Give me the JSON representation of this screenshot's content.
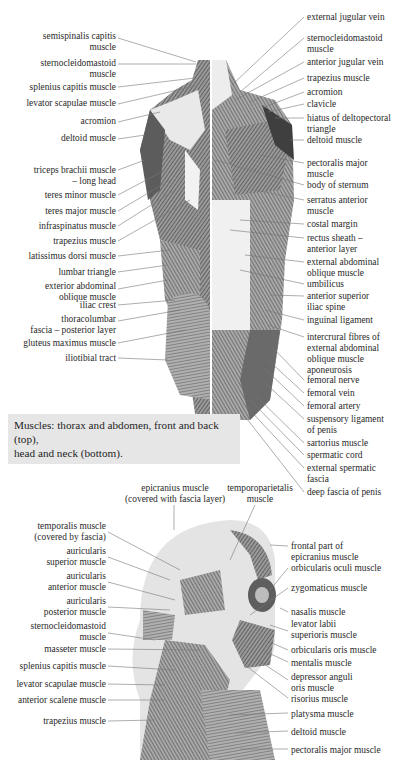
{
  "caption": {
    "line1": "Muscles: thorax and abdomen, front and back (top),",
    "line2": "head and neck (bottom)."
  },
  "top_figure": {
    "back_labels": [
      {
        "l1": "semispinalis capitis",
        "l2": "muscle"
      },
      {
        "l1": "sternocleidomastoid",
        "l2": "muscle"
      },
      {
        "l1": "splenius capitis muscle"
      },
      {
        "l1": "levator scapulae muscle"
      },
      {
        "l1": "acromion"
      },
      {
        "l1": "deltoid muscle"
      },
      {
        "l1": "triceps brachii muscle",
        "l2": "– long head"
      },
      {
        "l1": "teres minor muscle"
      },
      {
        "l1": "teres major muscle"
      },
      {
        "l1": "infraspinatus muscle"
      },
      {
        "l1": "trapezius muscle"
      },
      {
        "l1": "latissimus dorsi muscle"
      },
      {
        "l1": "lumbar triangle"
      },
      {
        "l1": "exterior abdominal",
        "l2": "oblique muscle"
      },
      {
        "l1": "iliac crest"
      },
      {
        "l1": "thoracolumbar",
        "l2": "fascia – posterior layer"
      },
      {
        "l1": "gluteus maximus muscle"
      },
      {
        "l1": "iliotibial tract"
      }
    ],
    "front_labels": [
      {
        "l1": "external jugular vein"
      },
      {
        "l1": "sternocleidomastoid",
        "l2": "muscle"
      },
      {
        "l1": "anterior jugular vein"
      },
      {
        "l1": "trapezius muscle"
      },
      {
        "l1": "acromion"
      },
      {
        "l1": "clavicle"
      },
      {
        "l1": "hiatus of deltopectoral",
        "l2": "triangle"
      },
      {
        "l1": "deltoid muscle"
      },
      {
        "l1": "pectoralis major",
        "l2": "muscle"
      },
      {
        "l1": "body of sternum"
      },
      {
        "l1": "serratus anterior",
        "l2": "muscle"
      },
      {
        "l1": "costal margin"
      },
      {
        "l1": "rectus sheath –",
        "l2": "anterior layer"
      },
      {
        "l1": "external abdominal",
        "l2": "oblique muscle"
      },
      {
        "l1": "umbilicus"
      },
      {
        "l1": "anterior superior",
        "l2": "iliac spine"
      },
      {
        "l1": "inguinal ligament"
      },
      {
        "l1": "intercrural fibres of",
        "l2": "external abdominal",
        "l3": "oblique muscle",
        "l4": "aponeurosis"
      },
      {
        "l1": "femoral nerve"
      },
      {
        "l1": "femoral vein"
      },
      {
        "l1": "femoral artery"
      },
      {
        "l1": "suspensory ligament",
        "l2": "of penis"
      },
      {
        "l1": "sartorius muscle"
      },
      {
        "l1": "spermatic cord"
      },
      {
        "l1": "external spermatic",
        "l2": "fascia"
      },
      {
        "l1": "deep fascia of penis"
      }
    ]
  },
  "bottom_figure": {
    "top_labels": [
      {
        "l1": "epicranius muscle",
        "l2": "(covered with fascia layer)"
      },
      {
        "l1": "temporoparietalis",
        "l2": "muscle"
      }
    ],
    "left_labels": [
      {
        "l1": "temporalis muscle",
        "l2": "(covered by fascia)"
      },
      {
        "l1": "auricularis",
        "l2": "superior muscle"
      },
      {
        "l1": "auricularis",
        "l2": "anterior muscle"
      },
      {
        "l1": "auricularis",
        "l2": "posterior muscle"
      },
      {
        "l1": "sternocleidomastoid",
        "l2": "muscle"
      },
      {
        "l1": "masseter muscle"
      },
      {
        "l1": "splenius capitis muscle"
      },
      {
        "l1": "levator scapulae muscle"
      },
      {
        "l1": "anterior scalene muscle"
      },
      {
        "l1": "trapezius muscle"
      }
    ],
    "right_labels": [
      {
        "l1": "frontal part of",
        "l2": "epicranius muscle"
      },
      {
        "l1": "orbicularis oculi muscle"
      },
      {
        "l1": "zygomaticus muscle"
      },
      {
        "l1": "nasalis muscle"
      },
      {
        "l1": "levator labii",
        "l2": "superioris muscle"
      },
      {
        "l1": "orbicularis oris muscle"
      },
      {
        "l1": "mentalis muscle"
      },
      {
        "l1": "depressor anguli",
        "l2": "oris muscle"
      },
      {
        "l1": "risorius muscle"
      },
      {
        "l1": "platysma muscle"
      },
      {
        "l1": "deltoid muscle"
      },
      {
        "l1": "pectoralis major muscle"
      }
    ]
  },
  "colors": {
    "muscle_dark": "#4a4a4a",
    "muscle_mid": "#8a8a8a",
    "muscle_light": "#c8c8c8",
    "caption_bg": "#e6e6e6",
    "leader_line": "#555555"
  }
}
